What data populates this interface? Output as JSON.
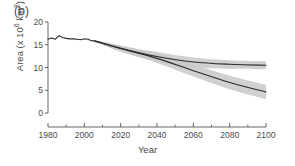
{
  "figure": {
    "panel_label": "(b)",
    "xlabel": "Year",
    "ylabel_text": "Area (x 10",
    "ylabel_exp": "6",
    "ylabel_tail": " km",
    "ylabel_exp2": "2",
    "ylabel_close": ")"
  },
  "axis": {
    "x_ticks": [
      "1980",
      "2000",
      "2020",
      "2040",
      "2060",
      "2080",
      "2100"
    ],
    "y_ticks": [
      "0",
      "5",
      "10",
      "15",
      "20"
    ]
  },
  "colors": {
    "line": "#2b2b2b",
    "band": "#c8c8c8",
    "axis": "#555555",
    "text": "#4a4a4a",
    "background": "#ffffff"
  },
  "chart_data": {
    "type": "line",
    "title": "(b)",
    "xlabel": "Year",
    "ylabel": "Area (x 10^6 km^2)",
    "xlim": [
      1980,
      2100
    ],
    "ylim": [
      0,
      20
    ],
    "x_ticks": [
      1980,
      2000,
      2020,
      2040,
      2060,
      2080,
      2100
    ],
    "y_ticks": [
      0,
      5,
      10,
      15,
      20
    ],
    "minor_x_ticks": [
      1990,
      2010,
      2030,
      2050,
      2070,
      2090
    ],
    "grid": false,
    "legend": null,
    "series": [
      {
        "name": "historical",
        "x": [
          1980,
          1982,
          1984,
          1986,
          1988,
          1990,
          1992,
          1994,
          1996,
          1998,
          2000,
          2002,
          2004,
          2006
        ],
        "values": [
          16.2,
          16.5,
          16.2,
          17.0,
          16.6,
          16.4,
          16.3,
          16.3,
          16.2,
          16.1,
          16.3,
          16.2,
          15.9,
          15.8
        ],
        "band_lower": null,
        "band_upper": null
      },
      {
        "name": "projection-low-forcing",
        "x": [
          2006,
          2020,
          2040,
          2060,
          2080,
          2100
        ],
        "values": [
          15.8,
          14.2,
          12.4,
          11.2,
          10.7,
          10.5
        ],
        "band_lower": [
          15.6,
          13.5,
          11.3,
          10.1,
          9.7,
          9.6
        ],
        "band_upper": [
          16.0,
          14.8,
          13.4,
          12.2,
          11.6,
          11.4
        ]
      },
      {
        "name": "projection-high-forcing",
        "x": [
          2006,
          2020,
          2040,
          2060,
          2080,
          2100
        ],
        "values": [
          15.8,
          14.2,
          12.0,
          9.3,
          6.7,
          4.6
        ],
        "band_lower": [
          15.6,
          13.5,
          11.0,
          8.0,
          5.2,
          3.0
        ],
        "band_upper": [
          16.0,
          14.8,
          13.0,
          10.6,
          8.2,
          6.2
        ]
      }
    ]
  }
}
